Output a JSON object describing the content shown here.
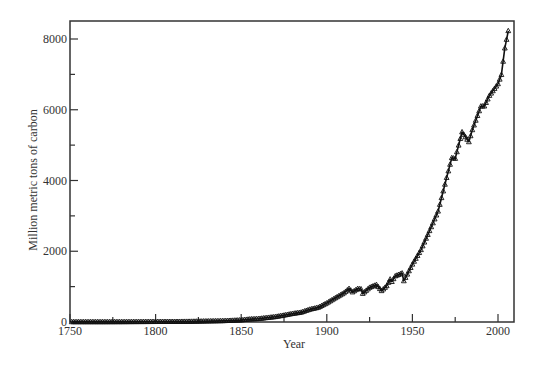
{
  "chart_data": {
    "type": "line",
    "title": "",
    "xlabel": "Year",
    "ylabel": "Million metric tons of carbon",
    "xlim": [
      1750,
      2009
    ],
    "ylim": [
      0,
      8500
    ],
    "xticks": [
      1750,
      1800,
      1850,
      1900,
      1950,
      2000
    ],
    "xticks_minor": [
      1775,
      1825,
      1875,
      1925,
      1975
    ],
    "yticks": [
      0,
      2000,
      4000,
      6000,
      8000
    ],
    "yticks_minor": [
      1000,
      3000,
      5000,
      7000
    ],
    "grid": false,
    "legend": null,
    "marker": "triangle",
    "line_color": "#111111",
    "series": [
      {
        "name": "Global carbon emissions",
        "x": [
          1751,
          1760,
          1770,
          1780,
          1790,
          1800,
          1810,
          1820,
          1830,
          1840,
          1850,
          1855,
          1860,
          1865,
          1870,
          1875,
          1880,
          1885,
          1890,
          1895,
          1900,
          1905,
          1910,
          1913,
          1915,
          1918,
          1920,
          1921,
          1925,
          1929,
          1932,
          1935,
          1937,
          1938,
          1940,
          1944,
          1945,
          1946,
          1950,
          1955,
          1960,
          1965,
          1970,
          1973,
          1975,
          1979,
          1980,
          1983,
          1985,
          1990,
          1992,
          1995,
          2000,
          2002,
          2004,
          2006
        ],
        "values": [
          3,
          3,
          3,
          4,
          6,
          8,
          10,
          14,
          24,
          33,
          54,
          80,
          91,
          120,
          147,
          190,
          236,
          272,
          356,
          410,
          534,
          680,
          819,
          943,
          845,
          940,
          932,
          803,
          975,
          1053,
          881,
          1021,
          1209,
          1139,
          1299,
          1380,
          1160,
          1255,
          1630,
          2040,
          2577,
          3130,
          4080,
          4640,
          4620,
          5370,
          5300,
          5090,
          5430,
          6100,
          6100,
          6400,
          6730,
          6990,
          7740,
          8230
        ]
      }
    ]
  },
  "axes": {
    "x_title": "Year",
    "y_title": "Million metric tons of carbon",
    "x_tick_labels": [
      "1750",
      "1800",
      "1850",
      "1900",
      "1950",
      "2000"
    ],
    "y_tick_labels": [
      "0",
      "2000",
      "4000",
      "6000",
      "8000"
    ]
  }
}
